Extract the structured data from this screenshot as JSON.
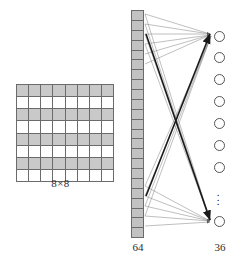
{
  "figure": {
    "type": "neural-network-diagram",
    "caption": ""
  },
  "input_grid": {
    "label": "8×8",
    "rows": 8,
    "cols": 8,
    "shaded_color": "#c9c9c9",
    "empty_color": "#ffffff",
    "border_color": "#6b6b6b",
    "cells": [
      [
        1,
        1,
        1,
        1,
        1,
        1,
        1,
        1
      ],
      [
        0,
        0,
        0,
        0,
        0,
        0,
        0,
        0
      ],
      [
        1,
        1,
        1,
        1,
        1,
        1,
        1,
        1
      ],
      [
        0,
        0,
        0,
        0,
        0,
        0,
        0,
        0
      ],
      [
        1,
        1,
        1,
        1,
        1,
        1,
        1,
        1
      ],
      [
        0,
        0,
        0,
        0,
        0,
        0,
        0,
        0
      ],
      [
        1,
        1,
        1,
        1,
        1,
        1,
        1,
        1
      ],
      [
        0,
        0,
        0,
        0,
        0,
        0,
        0,
        0
      ]
    ]
  },
  "input_layer": {
    "label": "64",
    "unit_count": 64,
    "drawn_cells": 23,
    "fill_color": "#c2c2c2",
    "border_color": "#6b6b6b"
  },
  "output_layer": {
    "label": "36",
    "unit_count": 36,
    "drawn_nodes": 8,
    "node_color": "#ffffff",
    "node_border_color": "#555555",
    "ellipsis": "⋮",
    "nodes": [
      {
        "cx": 219,
        "cy": 36
      },
      {
        "cx": 219,
        "cy": 57
      },
      {
        "cx": 219,
        "cy": 79
      },
      {
        "cx": 219,
        "cy": 101
      },
      {
        "cx": 219,
        "cy": 123
      },
      {
        "cx": 219,
        "cy": 145
      },
      {
        "cx": 219,
        "cy": 167
      },
      {
        "cx": 219,
        "cy": 221
      }
    ]
  },
  "connections": {
    "line_color": "#8a8a8a",
    "highlight_color": "#1a1a1a",
    "description": "fully-connected fan from 64 input units to 36 output units"
  }
}
